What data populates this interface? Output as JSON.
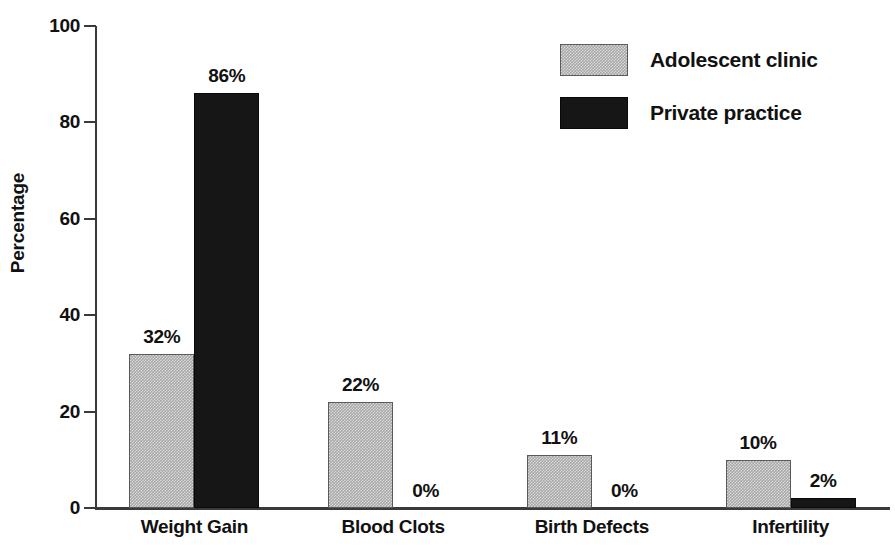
{
  "chart_data": {
    "type": "bar",
    "title": "",
    "xlabel": "",
    "ylabel": "Percentage",
    "ylim": [
      0,
      100
    ],
    "yticks": [
      0,
      20,
      40,
      60,
      80,
      100
    ],
    "ytick_labels": [
      "0",
      "20",
      "40",
      "60",
      "80",
      "100"
    ],
    "grid": false,
    "legend_position": "top-right",
    "categories": [
      "Weight Gain",
      "Blood Clots",
      "Birth Defects",
      "Infertility"
    ],
    "series": [
      {
        "name": "Adolescent clinic",
        "color": "#a8a8a8",
        "pattern": "stipple",
        "values": [
          32,
          22,
          11,
          10
        ],
        "value_labels": [
          "32%",
          "22%",
          "11%",
          "10%"
        ]
      },
      {
        "name": "Private practice",
        "color": "#161616",
        "pattern": "solid",
        "values": [
          86,
          0,
          0,
          2
        ],
        "value_labels": [
          "86%",
          "0%",
          "0%",
          "2%"
        ]
      }
    ]
  },
  "axis": {
    "y_title": "Percentage"
  },
  "legend": {
    "entries": [
      {
        "label": "Adolescent clinic",
        "swatch": "light"
      },
      {
        "label": "Private practice",
        "swatch": "dark"
      }
    ]
  }
}
